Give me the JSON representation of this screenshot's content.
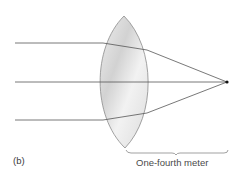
{
  "figure": {
    "panel_label": "(b)",
    "distance_label": "One-fourth meter"
  },
  "colors": {
    "ray": "#555555",
    "lens_stroke": "#8a8a8a",
    "lens_fill_light": "#f4f4f4",
    "lens_fill_dark": "#cfcfcf",
    "focal_point": "#111111",
    "brace": "#7a7a7a",
    "text": "#3a3a3a"
  },
  "diagram": {
    "lens": {
      "top": [
        124,
        16
      ],
      "bottom": [
        125,
        148
      ],
      "left_x": 97,
      "right_x": 152
    },
    "rays": [
      {
        "name": "top-ray",
        "start": [
          15,
          43
        ],
        "enter": [
          103,
          43
        ],
        "exit": [
          147,
          50
        ],
        "focus": [
          227,
          82
        ]
      },
      {
        "name": "middle-ray",
        "start": [
          15,
          82
        ],
        "enter": [
          97,
          82
        ],
        "exit": [
          152,
          82
        ],
        "focus": [
          227,
          82
        ]
      },
      {
        "name": "bottom-ray",
        "start": [
          15,
          120
        ],
        "enter": [
          103,
          120
        ],
        "exit": [
          147,
          113
        ],
        "focus": [
          227,
          82
        ]
      }
    ],
    "focal_point": [
      227,
      82
    ],
    "brace": {
      "x1": 126,
      "x2": 228,
      "y": 152
    }
  }
}
